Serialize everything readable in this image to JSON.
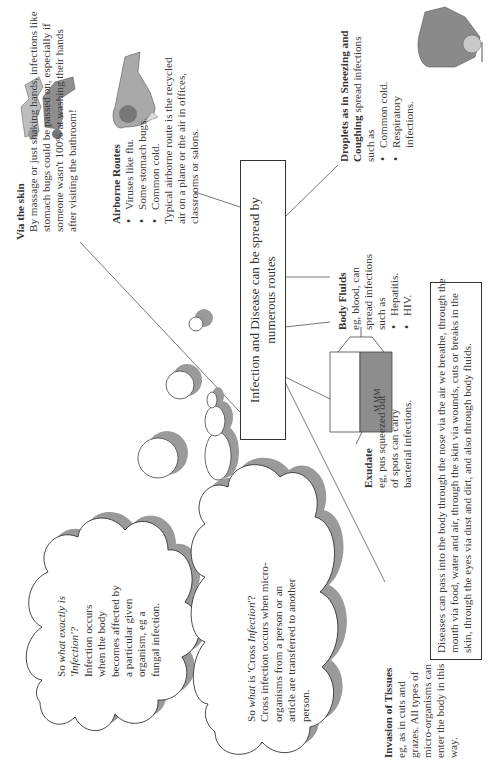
{
  "central_box": {
    "line1": "Infection and Disease can be spread by",
    "line2": "numerous routes"
  },
  "via_skin": {
    "title": "Via the skin",
    "lines": [
      "By massage or just shaking hands, infections like",
      "stomach bugs could be passed on, especially if",
      "someone wasn't 100% at washing their hands",
      "after visiting the bathroom!"
    ]
  },
  "airborne": {
    "title": "Airborne Routes",
    "bullets": [
      "Viruses like flu.",
      "Some stomach bugs.",
      "Common cold."
    ],
    "note_lines": [
      "Typical airborne route is the recycled",
      "air on a plane or the air in offices,",
      "classrooms or salons."
    ]
  },
  "droplets": {
    "title_line1": "Droplets as in Sneezing and",
    "title_line2_bold": "Coughing",
    "title_line2_rest": " spread infections",
    "line3": "such as",
    "bullets": [
      "Common cold.",
      "Respiratory",
      "infections."
    ]
  },
  "body_fluids": {
    "title": "Body Fluids",
    "lines": [
      "eg, blood, can",
      "spread infections",
      "such as"
    ],
    "bullets": [
      "Hepatitis.",
      "HIV."
    ]
  },
  "exudate": {
    "title": "Exudate",
    "lines": [
      "eg, pus squeezed out",
      "of spots can carry",
      "bacterial infections."
    ]
  },
  "invasion": {
    "title": "Invasion of Tissues",
    "lines": [
      "eg, as in cuts and",
      "grazes. All types of",
      "micro-organisms can",
      "enter the body in this",
      "way."
    ]
  },
  "bottom_box": {
    "lines": [
      "Diseases can pass into the body through the nose via the air we breathe, through the",
      "mouth via food, water and air, through the skin via wounds, cuts or breaks in the",
      "skin, through the eyes via dust and dirt, and also through body fluids."
    ]
  },
  "cloud_infection": {
    "q_prefix": "So ",
    "q_italic": "what exactly is",
    "q_line2": "'Infection'?",
    "lines": [
      "Infection occurs",
      "when the body",
      "becomes affected by",
      "a particular given",
      "organism, eg a",
      "fungal infection."
    ]
  },
  "cloud_cross": {
    "q_prefix": "So ",
    "q_italic1": "what",
    "q_mid": " is 'Cross ",
    "q_italic2": "Infection",
    "q_end": "'?",
    "lines": [
      "Cross infection occurs when micro-",
      "organisms from a person or an",
      "article are transferred to another",
      "person."
    ]
  },
  "illustrations": {
    "handshake": "handshake-illustration",
    "sneezing_person": "sneezing-person-illustration",
    "coughing_person": "coughing-person-illustration",
    "iv_bag": "iv-blood-bag-illustration"
  },
  "colors": {
    "text": "#3a3a3a",
    "line": "#555555",
    "shadow": "#9a9a9a",
    "box_border": "#333333"
  }
}
